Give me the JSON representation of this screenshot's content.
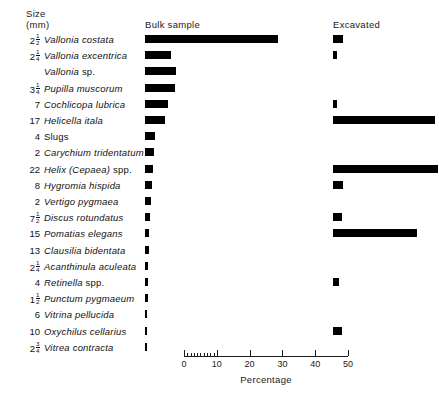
{
  "header": {
    "size_label_line1": "Size",
    "size_label_line2": "(mm)",
    "bulk_label": "Bulk sample",
    "excavated_label": "Excavated"
  },
  "axis": {
    "title": "Percentage",
    "major_ticks": [
      0,
      10,
      20,
      30,
      40,
      50
    ],
    "minor_ticks": [
      1,
      2,
      3,
      4,
      5,
      6,
      7,
      8,
      9
    ],
    "min": 0,
    "max": 50
  },
  "colors": {
    "bar": "#000000",
    "text": "#111111",
    "background": "#ffffff"
  },
  "chart_data": {
    "type": "bar",
    "title": "",
    "xlabel": "Percentage",
    "ylabel": "",
    "xlim": [
      0,
      50
    ],
    "grid": false,
    "orientation": "horizontal",
    "legend_position": "top",
    "categories": [
      "Vallonia costata",
      "Vallonia excentrica",
      "Vallonia sp.",
      "Pupilla muscorum",
      "Cochlicopa lubrica",
      "Helicella itala",
      "Slugs",
      "Carychium tridentatum",
      "Helix (Cepaea) spp.",
      "Hygromia hispida",
      "Vertigo pygmaea",
      "Discus rotundatus",
      "Pomatias elegans",
      "Clausilia bidentata",
      "Acanthinula aculeata",
      "Retinella spp.",
      "Punctum pygmaeum",
      "Vitrina pellucida",
      "Oxychilus cellarius",
      "Vitrea contracta"
    ],
    "sizes_mm": [
      "2 1/2",
      "2 1/4",
      "",
      "3 1/4",
      "7",
      "17",
      "4",
      "2",
      "22",
      "8",
      "2",
      "7 1/2",
      "15",
      "13",
      "2 1/4",
      "4",
      "1 1/2",
      "6",
      "10",
      "2 3/4"
    ],
    "series": [
      {
        "name": "Bulk sample",
        "values": [
          40.5,
          8.0,
          9.5,
          9.0,
          7.0,
          6.0,
          3.2,
          2.6,
          2.4,
          2.0,
          1.7,
          1.5,
          1.3,
          1.1,
          1.0,
          0.9,
          0.8,
          0.7,
          0.6,
          0.5
        ]
      },
      {
        "name": "Excavated",
        "values": [
          3.0,
          1.2,
          0,
          0,
          1.2,
          31.0,
          0,
          0,
          32.0,
          3.2,
          0,
          2.8,
          25.5,
          0,
          0,
          1.8,
          0,
          0,
          2.6,
          0
        ]
      }
    ]
  },
  "rows": [
    {
      "size": "2",
      "frac_num": "1",
      "frac_den": "2",
      "name": "Vallonia costata",
      "italic": true,
      "suffix": "",
      "bulk": 40.5,
      "exc": 3.0
    },
    {
      "size": "2",
      "frac_num": "1",
      "frac_den": "4",
      "name": "Vallonia excentrica",
      "italic": true,
      "suffix": "",
      "bulk": 8.0,
      "exc": 1.2
    },
    {
      "size": "",
      "frac_num": "",
      "frac_den": "",
      "name": "Vallonia",
      "italic": true,
      "suffix": "sp.",
      "bulk": 9.5,
      "exc": 0
    },
    {
      "size": "3",
      "frac_num": "1",
      "frac_den": "4",
      "name": "Pupilla muscorum",
      "italic": true,
      "suffix": "",
      "bulk": 9.0,
      "exc": 0
    },
    {
      "size": "7",
      "frac_num": "",
      "frac_den": "",
      "name": "Cochlicopa lubrica",
      "italic": true,
      "suffix": "",
      "bulk": 7.0,
      "exc": 1.2
    },
    {
      "size": "17",
      "frac_num": "",
      "frac_den": "",
      "name": "Helicella itala",
      "italic": true,
      "suffix": "",
      "bulk": 6.0,
      "exc": 31.0
    },
    {
      "size": "4",
      "frac_num": "",
      "frac_den": "",
      "name": "",
      "italic": false,
      "suffix": "Slugs",
      "bulk": 3.2,
      "exc": 0
    },
    {
      "size": "2",
      "frac_num": "",
      "frac_den": "",
      "name": "Carychium tridentatum",
      "italic": true,
      "suffix": "",
      "bulk": 2.6,
      "exc": 0
    },
    {
      "size": "22",
      "frac_num": "",
      "frac_den": "",
      "name": "Helix (Cepaea)",
      "italic": true,
      "suffix": "spp.",
      "bulk": 2.4,
      "exc": 32.0
    },
    {
      "size": "8",
      "frac_num": "",
      "frac_den": "",
      "name": "Hygromia hispida",
      "italic": true,
      "suffix": "",
      "bulk": 2.0,
      "exc": 3.2
    },
    {
      "size": "2",
      "frac_num": "",
      "frac_den": "",
      "name": "Vertigo pygmaea",
      "italic": true,
      "suffix": "",
      "bulk": 1.7,
      "exc": 0
    },
    {
      "size": "7",
      "frac_num": "1",
      "frac_den": "2",
      "name": "Discus rotundatus",
      "italic": true,
      "suffix": "",
      "bulk": 1.5,
      "exc": 2.8
    },
    {
      "size": "15",
      "frac_num": "",
      "frac_den": "",
      "name": "Pomatias elegans",
      "italic": true,
      "suffix": "",
      "bulk": 1.3,
      "exc": 25.5
    },
    {
      "size": "13",
      "frac_num": "",
      "frac_den": "",
      "name": "Clausilia bidentata",
      "italic": true,
      "suffix": "",
      "bulk": 1.1,
      "exc": 0
    },
    {
      "size": "2",
      "frac_num": "1",
      "frac_den": "4",
      "name": "Acanthinula aculeata",
      "italic": true,
      "suffix": "",
      "bulk": 1.0,
      "exc": 0
    },
    {
      "size": "4",
      "frac_num": "",
      "frac_den": "",
      "name": "Retinella",
      "italic": true,
      "suffix": "spp.",
      "bulk": 0.9,
      "exc": 1.8
    },
    {
      "size": "1",
      "frac_num": "1",
      "frac_den": "2",
      "name": "Punctum pygmaeum",
      "italic": true,
      "suffix": "",
      "bulk": 0.8,
      "exc": 0
    },
    {
      "size": "6",
      "frac_num": "",
      "frac_den": "",
      "name": "Vitrina pellucida",
      "italic": true,
      "suffix": "",
      "bulk": 0.7,
      "exc": 0
    },
    {
      "size": "10",
      "frac_num": "",
      "frac_den": "",
      "name": "Oxychilus cellarius",
      "italic": true,
      "suffix": "",
      "bulk": 0.6,
      "exc": 2.6
    },
    {
      "size": "2",
      "frac_num": "3",
      "frac_den": "4",
      "name": "Vitrea contracta",
      "italic": true,
      "suffix": "",
      "bulk": 0.5,
      "exc": 0
    }
  ]
}
